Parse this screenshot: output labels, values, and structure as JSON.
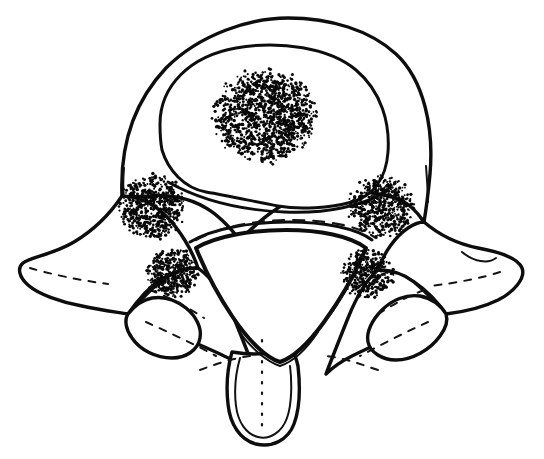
{
  "figure": {
    "title": "Transverse section of a vertebra (axial view)",
    "caption": "",
    "medium": "black-and-white line drawing with stipple shading",
    "canvas": {
      "width": 544,
      "height": 459,
      "background": "#ffffff"
    },
    "ink_color": "#0d0d0d",
    "stipple_color": "#090909"
  },
  "anatomy": {
    "structures": [
      {
        "id": "vertebral-body",
        "label": "Vertebral body",
        "note": "large rounded anterior mass, double contour"
      },
      {
        "id": "vertebral-body-inner-ring",
        "label": "Inner cortical ring of body",
        "note": "concentric oval inside the body"
      },
      {
        "id": "vertebral-foramen",
        "label": "Vertebral foramen",
        "note": "rounded triangle, apex inferior"
      },
      {
        "id": "left-transverse-process",
        "label": "Left transverse process",
        "note": "wing projecting laterally left"
      },
      {
        "id": "right-transverse-process",
        "label": "Right transverse process",
        "note": "wing projecting laterally right"
      },
      {
        "id": "left-pedicle",
        "label": "Left pedicle",
        "note": "bridge between body and arch"
      },
      {
        "id": "right-pedicle",
        "label": "Right pedicle",
        "note": "bridge between body and arch"
      },
      {
        "id": "left-articular-process",
        "label": "Left articular process",
        "note": "rounded lobe below transverse process"
      },
      {
        "id": "right-articular-process",
        "label": "Right articular process",
        "note": "rounded lobe below transverse process"
      },
      {
        "id": "left-lamina",
        "label": "Left lamina",
        "note": "posterior arch plate"
      },
      {
        "id": "right-lamina",
        "label": "Right lamina",
        "note": "posterior arch plate"
      },
      {
        "id": "spinous-process",
        "label": "Spinous process",
        "note": "tongue-shaped midline projection pointing inferiorly"
      }
    ]
  },
  "stipple_patches": [
    {
      "id": "patch-body-center",
      "label": "Central body stipple",
      "cx": 265,
      "cy": 116,
      "rx": 52,
      "ry": 46,
      "dots": 1750,
      "seed": 11
    },
    {
      "id": "patch-left-upper",
      "label": "Left pedicle stipple",
      "cx": 152,
      "cy": 207,
      "rx": 33,
      "ry": 32,
      "dots": 760,
      "seed": 23
    },
    {
      "id": "patch-right-upper",
      "label": "Right pedicle stipple",
      "cx": 381,
      "cy": 207,
      "rx": 33,
      "ry": 31,
      "dots": 760,
      "seed": 37
    },
    {
      "id": "patch-left-lower",
      "label": "Left articular stipple",
      "cx": 173,
      "cy": 273,
      "rx": 27,
      "ry": 25,
      "dots": 520,
      "seed": 53
    },
    {
      "id": "patch-right-lower",
      "label": "Right articular stipple",
      "cx": 367,
      "cy": 274,
      "rx": 27,
      "ry": 25,
      "dots": 520,
      "seed": 71
    }
  ],
  "stipple_style": {
    "dot_min_radius": 0.85,
    "dot_max_radius": 1.75,
    "edge_falloff": 0.55
  },
  "paths": {
    "body_outer": "M 122 196 C 120 150 132 104 166 68 C 200 34 250 18 288 18 C 330 18 370 30 396 54 C 424 80 434 128 430 174 C 428 196 426 210 424 222 C 420 216 412 205 400 200 C 382 192 352 190 330 192 C 306 194 288 200 272 212 C 258 222 248 232 240 240 C 232 230 220 216 206 208 C 190 198 168 194 150 196 C 138 197 128 197 122 196 Z",
    "body_inner": "M 160 124 C 160 86 190 56 236 48 C 280 40 330 48 356 70 C 382 92 390 124 388 152 C 386 180 372 196 352 202 C 330 208 300 210 278 206 C 256 202 230 196 206 192 C 184 188 168 170 162 150 C 160 140 160 132 160 124 Z",
    "body_inner_lower_edge": "M 168 176 C 196 196 232 206 276 208 C 318 210 356 204 382 188",
    "body_left_flank": "M 122 196 C 112 212 98 228 80 240 C 58 254 34 256 25 262 C 18 266 18 276 26 284 C 36 294 58 302 80 306 C 96 309 112 310 124 310",
    "body_right_flank": "M 424 222 C 438 232 456 242 476 246 C 498 250 518 256 522 266 C 526 276 516 290 500 298 C 486 305 466 310 448 312",
    "tp_left_outline": "M 122 196 C 110 214 94 230 74 242 C 52 255 30 257 23 263 C 17 268 19 277 28 285 C 38 294 60 302 82 306 C 100 310 116 312 128 314 C 138 300 148 288 160 280 C 172 272 186 268 198 268 C 192 250 180 230 166 216 C 152 202 136 196 122 196 Z",
    "tp_right_outline": "M 424 222 C 438 234 458 244 478 248 C 500 252 518 258 522 268 C 526 278 514 292 498 300 C 482 308 462 312 446 314 C 436 300 426 290 414 282 C 402 274 390 270 378 270 C 384 252 396 236 408 228 C 414 224 420 222 424 222 Z",
    "ap_left_outline": "M 128 314 C 134 306 142 300 152 298 C 164 296 176 300 186 308 C 196 316 202 328 200 338 C 198 350 186 358 172 358 C 156 358 140 350 132 338 C 126 330 124 320 128 314 Z",
    "ap_right_outline": "M 446 314 C 440 304 430 298 420 296 C 406 294 392 300 382 310 C 372 320 366 332 368 342 C 370 352 382 360 396 360 C 412 360 430 350 440 336 C 446 328 448 320 446 314 Z",
    "lamina_left": "M 198 268 C 186 268 172 272 160 282 C 148 292 138 302 130 314 C 142 320 156 326 170 332 C 188 340 208 348 224 356 C 238 362 248 368 256 374 C 250 358 242 338 234 318 C 226 298 214 280 198 268 Z",
    "lamina_right": "M 378 270 C 390 270 404 274 414 282 C 426 292 436 302 444 314 C 432 320 418 326 404 332 C 386 340 368 348 352 356 C 340 362 332 368 326 374 C 332 358 340 338 348 318 C 356 298 366 280 378 270 Z",
    "spinous_outline": "M 232 352 C 228 366 226 386 228 404 C 230 424 240 440 256 444 C 272 448 288 440 294 424 C 300 408 300 384 298 366 C 296 358 294 352 292 348 C 280 352 266 354 254 354 C 246 354 238 353 232 352 Z",
    "spinous_inner": "M 240 358 C 236 372 234 390 236 406 C 238 422 246 434 258 437 C 270 440 282 432 287 418 C 292 404 292 382 290 366",
    "spinous_midline": "M 262 340 L 262 432",
    "foramen": "M 196 248 C 216 236 252 230 286 230 C 320 230 350 236 366 248 C 356 272 340 300 324 322 C 308 344 292 358 280 362 C 266 358 248 340 232 316 C 216 292 204 268 196 248 Z",
    "foramen_rim_top": "M 190 242 C 214 228 252 222 288 222 C 324 222 356 228 372 240",
    "foramen_rim_left": "M 198 252 C 208 276 222 302 238 324",
    "foramen_rim_right": "M 364 252 C 354 278 338 306 320 328",
    "foramen_rim_bottom": "M 238 330 C 252 350 268 362 280 366 C 292 362 306 350 318 332",
    "body_under_shadow": "M 168 182 C 200 200 240 210 284 212 C 326 214 364 206 388 190",
    "arch_top_dash": "M 196 240 C 222 226 258 220 292 220 C 328 220 358 226 376 238",
    "left_arch_dash": "M 150 290 C 166 296 186 306 204 318",
    "right_arch_dash": "M 424 290 C 408 296 390 306 372 318",
    "lamina_left_dash": "M 146 322 C 168 332 194 344 216 356",
    "lamina_right_dash": "M 428 322 C 406 332 382 344 360 356",
    "post_arch_dash_left": "M 200 370 C 216 364 234 358 250 356",
    "post_arch_dash_right": "M 378 370 C 360 364 344 358 326 356",
    "tp_left_detail": "M 30 268 C 50 274 78 280 108 284",
    "tp_right_detail": "M 500 272 C 482 278 456 283 430 286",
    "tp_right_notch": "M 462 252 C 474 262 488 264 496 258",
    "body_left_edge_detail": "M 124 168 C 123 180 123 190 124 198",
    "body_right_edge_detail": "M 426 166 C 427 180 428 192 428 202"
  }
}
